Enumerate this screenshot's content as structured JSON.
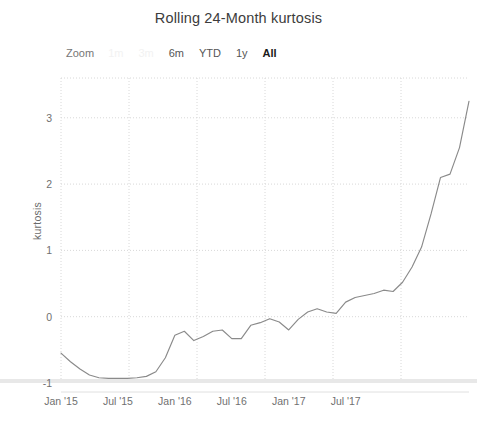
{
  "chart": {
    "title": "Rolling 24-Month kurtosis"
  },
  "range_selector": {
    "label": "Zoom",
    "buttons": [
      {
        "label": "1m",
        "state": "disabled"
      },
      {
        "label": "3m",
        "state": "disabled"
      },
      {
        "label": "6m",
        "state": "enabled"
      },
      {
        "label": "YTD",
        "state": "enabled"
      },
      {
        "label": "1y",
        "state": "enabled"
      },
      {
        "label": "All",
        "state": "selected"
      }
    ]
  },
  "colors": {
    "line": "#8a8a8a",
    "gridline": "#d8d8d8",
    "axis_text": "#707070",
    "title_text": "#3c3c3c",
    "background": "#ffffff",
    "baseline_band": "#e8e8e8",
    "disabled_button": "#f2f2f2"
  },
  "chart_data": {
    "type": "line",
    "title": "Rolling 24-Month kurtosis",
    "xlabel": "",
    "ylabel": "kurtosis",
    "ylim": [
      -1,
      3.6
    ],
    "yticks": [
      -1,
      0,
      1,
      2,
      3
    ],
    "ytick_labels": [
      "-1",
      "0",
      "1",
      "2",
      "3"
    ],
    "xtick_labels": [
      "Jan '15",
      "Jul '15",
      "Jan '16",
      "Jul '16",
      "Jan '17",
      "Jul '17"
    ],
    "xtick_values": [
      "2015-01",
      "2015-07",
      "2016-01",
      "2016-07",
      "2017-01",
      "2017-07"
    ],
    "grid": true,
    "legend": false,
    "series": [
      {
        "name": "kurtosis",
        "color": "#8a8a8a",
        "x": [
          "2015-01",
          "2015-02",
          "2015-03",
          "2015-04",
          "2015-05",
          "2015-06",
          "2015-07",
          "2015-08",
          "2015-09",
          "2015-10",
          "2015-11",
          "2015-12",
          "2016-01",
          "2016-02",
          "2016-03",
          "2016-04",
          "2016-05",
          "2016-06",
          "2016-07",
          "2016-08",
          "2016-09",
          "2016-10",
          "2016-11",
          "2016-12",
          "2017-01",
          "2017-02",
          "2017-03",
          "2017-04",
          "2017-05",
          "2017-06",
          "2017-07",
          "2017-08",
          "2017-09",
          "2017-10",
          "2017-11",
          "2017-12",
          "2018-01"
        ],
        "values": [
          -0.55,
          -0.68,
          -0.79,
          -0.88,
          -0.92,
          -0.93,
          -0.93,
          -0.93,
          -0.92,
          -0.9,
          -0.83,
          -0.62,
          -0.28,
          -0.22,
          -0.36,
          -0.3,
          -0.22,
          -0.2,
          -0.33,
          -0.33,
          -0.13,
          -0.09,
          -0.03,
          -0.08,
          -0.2,
          -0.04,
          0.07,
          0.12,
          0.07,
          0.05,
          0.22,
          0.29,
          0.32,
          0.35,
          0.4,
          0.38,
          0.52
        ]
      }
    ],
    "annotations": [
      "Line rises steeply after late 2017, reaching about 3.25 at the right edge."
    ]
  }
}
